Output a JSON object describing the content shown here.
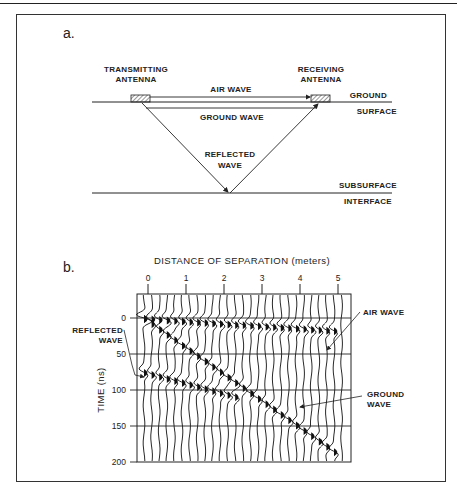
{
  "panel_a": {
    "label": "a.",
    "transmitter": [
      "TRANSMITTING",
      "ANTENNA"
    ],
    "receiver": [
      "RECEIVING",
      "ANTENNA"
    ],
    "air_wave": "AIR WAVE",
    "ground_wave": "GROUND WAVE",
    "reflected_wave": [
      "REFLECTED",
      "WAVE"
    ],
    "ground_surface": [
      "GROUND",
      "SURFACE"
    ],
    "subsurface_interface": [
      "SUBSURFACE",
      "INTERFACE"
    ]
  },
  "panel_b": {
    "label": "b.",
    "x_title": "DISTANCE OF SEPARATION (meters)",
    "y_title": "TIME (ns)",
    "x_ticks": [
      "0",
      "1",
      "2",
      "3",
      "4",
      "5"
    ],
    "y_ticks": [
      "0",
      "50",
      "100",
      "150",
      "200"
    ],
    "annotations": {
      "air_wave": "AIR WAVE",
      "reflected_wave": [
        "REFLECTED",
        "WAVE"
      ],
      "ground_wave": [
        "GROUND",
        "WAVE"
      ]
    }
  },
  "chart_data": {
    "type": "wiggle-trace radargram",
    "title": "DISTANCE OF SEPARATION (meters)",
    "xlabel": "DISTANCE OF SEPARATION (meters)",
    "ylabel": "TIME (ns)",
    "xlim": [
      0,
      5.3
    ],
    "ylim": [
      200,
      -30
    ],
    "x_ticks": [
      0,
      1,
      2,
      3,
      4,
      5
    ],
    "y_ticks": [
      0,
      50,
      100,
      150,
      200
    ],
    "grid": "horizontal at 0, 50, 100, 150",
    "events": [
      {
        "name": "AIR WAVE",
        "x": [
          0,
          5
        ],
        "t": [
          0,
          17
        ]
      },
      {
        "name": "GROUND WAVE",
        "x": [
          0,
          5
        ],
        "t": [
          0,
          185
        ]
      },
      {
        "name": "REFLECTED WAVE",
        "x": [
          0,
          2.5
        ],
        "t": [
          75,
          110
        ]
      }
    ]
  }
}
